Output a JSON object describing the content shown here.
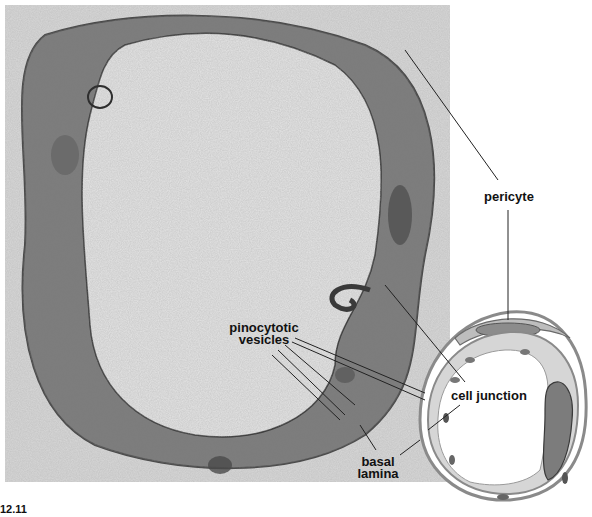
{
  "figure": {
    "number": "12.11",
    "type": "electron micrograph with schematic diagram"
  },
  "labels": {
    "pericyte": "pericyte",
    "pinocytotic_line1": "pinocytotic",
    "pinocytotic_line2": "vesicles",
    "cell_junction": "cell junction",
    "basal_line1": "basal",
    "basal_line2": "lamina"
  },
  "colors": {
    "background": "#ffffff",
    "micrograph_light": "#dcdcdc",
    "micrograph_dark": "#6a6a6a",
    "leader_line": "#222222",
    "diagram_wall": "#8a8a8a",
    "diagram_cytoplasm": "#d6d6d6",
    "nucleus": "#7c7c7c"
  }
}
